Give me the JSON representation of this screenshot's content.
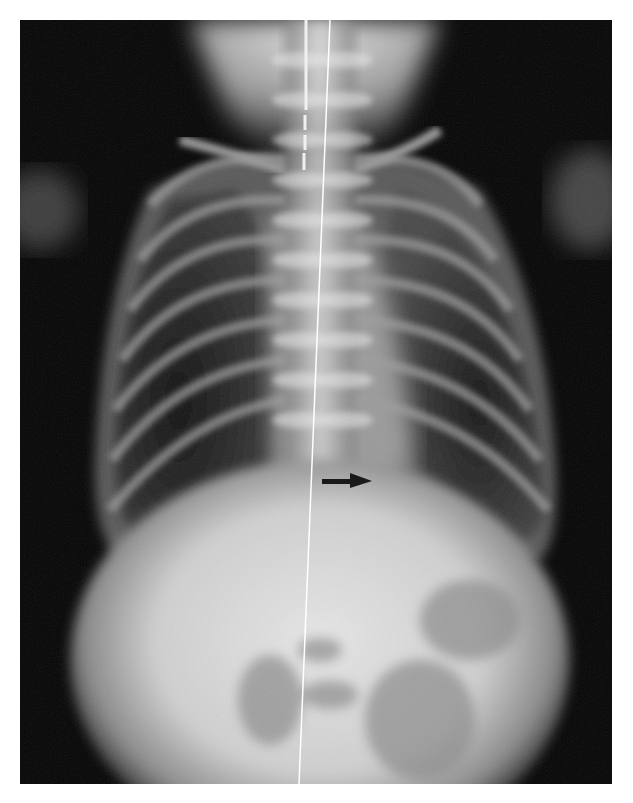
{
  "image": {
    "type": "radiograph",
    "view": "frontal chest and abdomen (infant)",
    "background": "#ffffff",
    "film_color": "#050505"
  },
  "annotations": {
    "arrows": [
      {
        "name": "pointer-arrow",
        "from": [
          322,
          481
        ],
        "to": [
          372,
          481
        ],
        "color": "#1a1a1a",
        "direction": "right"
      }
    ],
    "lines": [
      {
        "name": "midline-reference-line",
        "from": [
          330,
          20
        ],
        "to": [
          299,
          784
        ],
        "color": "#ffffff"
      },
      {
        "name": "enteric-tube",
        "from": [
          306,
          20
        ],
        "to": [
          304,
          170
        ],
        "color": "#f0f0f0",
        "style": "segmented"
      }
    ]
  },
  "caption": ""
}
